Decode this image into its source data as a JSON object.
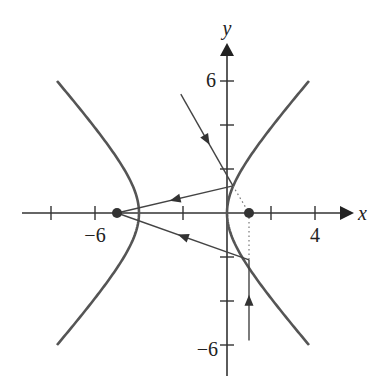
{
  "chart_data": {
    "type": "diagram",
    "xlabel": "x",
    "ylabel": "y",
    "x_tick_labels": [
      {
        "value": -6,
        "label": "−6"
      },
      {
        "value": 4,
        "label": "4"
      }
    ],
    "y_tick_labels": [
      {
        "value": 6,
        "label": "6"
      },
      {
        "value": -6,
        "label": "−6"
      }
    ],
    "x_ticks": [
      -8,
      -6,
      -2,
      2,
      4
    ],
    "y_ticks": [
      6,
      4,
      2,
      -2,
      -4,
      -6
    ],
    "xlim": [
      -9.3,
      6
    ],
    "ylim": [
      -7.2,
      7.6
    ],
    "hyperbola": {
      "equation": "(x+2)^2/4 - y^2/5 = 1",
      "center": [
        -2,
        0
      ],
      "a": 2,
      "b_squared": 5,
      "vertices": [
        [
          -4,
          0
        ],
        [
          0,
          0
        ]
      ],
      "y_range": [
        -6,
        6
      ]
    },
    "foci": [
      [
        -5,
        0
      ],
      [
        1,
        0
      ]
    ],
    "rays": [
      {
        "name": "incoming-ray-1",
        "from": [
          -2.1,
          5.4
        ],
        "to": [
          0.27,
          1.23
        ],
        "direction": "toward right focus"
      },
      {
        "name": "reflected-ray-1",
        "from": [
          0.27,
          1.23
        ],
        "to": [
          -5,
          0
        ],
        "direction": "toward left focus"
      },
      {
        "name": "incoming-ray-2",
        "from": [
          1,
          -5.8
        ],
        "to": [
          1,
          -2.13
        ],
        "direction": "upward toward right focus"
      },
      {
        "name": "reflected-ray-2",
        "from": [
          1,
          -2.13
        ],
        "to": [
          -5,
          0
        ],
        "direction": "toward left focus"
      }
    ],
    "dotted_segments": [
      {
        "from": [
          0.27,
          1.23
        ],
        "to": [
          1,
          0
        ]
      },
      {
        "from": [
          1,
          0
        ],
        "to": [
          1,
          -2.13
        ]
      }
    ]
  },
  "labels": {
    "x_axis": "x",
    "y_axis": "y",
    "x_neg6": "−6",
    "x_4": "4",
    "y_6": "6",
    "y_neg6": "−6"
  },
  "colors": {
    "curve": "#555555",
    "axis": "#333333",
    "ray": "#444444"
  }
}
